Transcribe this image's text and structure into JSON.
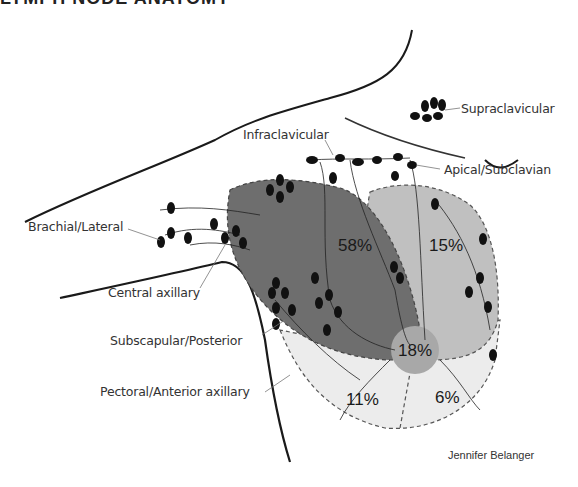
{
  "header": {
    "title": "LYMPH NODE ANATOMY"
  },
  "lymph_node_groups": [
    {
      "id": "supraclavicular",
      "label": "Supraclavicular"
    },
    {
      "id": "infraclavicular",
      "label": "Infraclavicular"
    },
    {
      "id": "apical",
      "label": "Apical/Subclavian"
    },
    {
      "id": "brachial",
      "label": "Brachial/Lateral"
    },
    {
      "id": "central",
      "label": "Central axillary"
    },
    {
      "id": "subscapular",
      "label": "Subscapular/Posterior"
    },
    {
      "id": "pectoral",
      "label": "Pectoral/Anterior axillary"
    }
  ],
  "quadrants": [
    {
      "id": "upper-outer",
      "label": "58%",
      "color": "#6e6e6e"
    },
    {
      "id": "upper-inner",
      "label": "15%",
      "color": "#bdbdbd"
    },
    {
      "id": "central",
      "label": "18%",
      "color": "#a8a8a8"
    },
    {
      "id": "lower-outer",
      "label": "11%",
      "color": "#e6e6e6"
    },
    {
      "id": "lower-inner",
      "label": "6%",
      "color": "#f0f0f0"
    }
  ],
  "credit": "Jennifer Belanger"
}
